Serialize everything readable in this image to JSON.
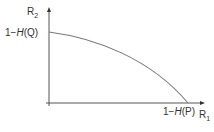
{
  "diagram": {
    "type": "capacity-region",
    "y_axis": {
      "label": "R",
      "subscript": "2"
    },
    "x_axis": {
      "label": "R",
      "subscript": "1"
    },
    "y_intercept": {
      "prefix": "1−",
      "func": "H",
      "arg": "(Q)"
    },
    "x_intercept": {
      "prefix": "1−",
      "func": "H",
      "arg": "(P)"
    },
    "colors": {
      "axis": "#444444",
      "curve": "#666666",
      "text": "#333333"
    }
  }
}
